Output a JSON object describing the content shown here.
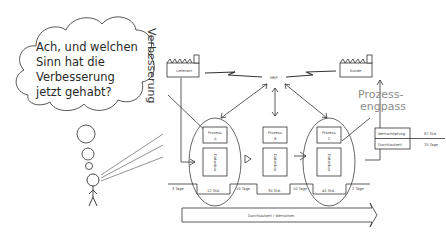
{
  "thought_bubble": {
    "lines": [
      "Ach, und welchen",
      "Sinn hat die",
      "Verbesserung",
      "jetzt gehabt?"
    ]
  },
  "side_label": "Verbesserung",
  "bottleneck_label": {
    "line1": "Prozess-",
    "line2": "engpass"
  },
  "supplier": {
    "label": "Lieferant"
  },
  "customer": {
    "label": "Kunde"
  },
  "control": {
    "label": "MRP"
  },
  "processes": [
    {
      "title": "Prozess",
      "letter": "A",
      "databox": "Datenbox"
    },
    {
      "title": "Prozess",
      "letter": "B",
      "databox": "Datenbox"
    },
    {
      "title": "Prozess",
      "letter": "C",
      "databox": "Datenbox"
    }
  ],
  "timeline": {
    "wait_times": [
      "3 Tage",
      "10 Tage",
      "10 Tage",
      "2 Tage"
    ],
    "process_times": [
      "12 Std.",
      "30 Std.",
      "45 Std."
    ]
  },
  "summary": {
    "rows": [
      {
        "label": "Wertschöpfung",
        "value": "87 Std."
      },
      {
        "label": "Durchlaufzeit",
        "value": "25 Tage"
      }
    ]
  },
  "flow_arrow": {
    "label": "Durchlaufzeit / Wertstrom"
  }
}
